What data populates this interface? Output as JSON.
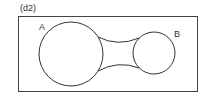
{
  "figure": {
    "panel_label": "(d2)",
    "set_a_label": "A",
    "set_b_label": "B"
  },
  "colors": {
    "stroke": "#333333",
    "background": "#ffffff"
  }
}
